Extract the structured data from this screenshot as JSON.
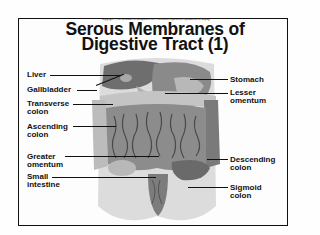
{
  "copyright": "Copyright © The McGraw-Hill Companies, Inc. Permission required for reproduction or display.",
  "title": {
    "line1": "Serous Membranes of",
    "line2": "Digestive Tract (1)"
  },
  "labels_left": [
    {
      "line1": "Liver",
      "line2": ""
    },
    {
      "line1": "Gallbladder",
      "line2": ""
    },
    {
      "line1": "Transverse",
      "line2": "colon"
    },
    {
      "line1": "Ascending",
      "line2": "colon"
    },
    {
      "line1": "Greater",
      "line2": "omentum"
    },
    {
      "line1": "Small",
      "line2": "intestine"
    }
  ],
  "labels_right": [
    {
      "line1": "Stomach",
      "line2": ""
    },
    {
      "line1": "Lesser",
      "line2": "omentum"
    },
    {
      "line1": "Descending",
      "line2": "colon"
    },
    {
      "line1": "Sigmoid",
      "line2": "colon"
    }
  ],
  "colors": {
    "frame": "#111111",
    "background": "#fdfdfd",
    "tissue_light": "#d4d4d4",
    "tissue_mid": "#9a9a9a",
    "tissue_dark": "#5a5a5a"
  }
}
